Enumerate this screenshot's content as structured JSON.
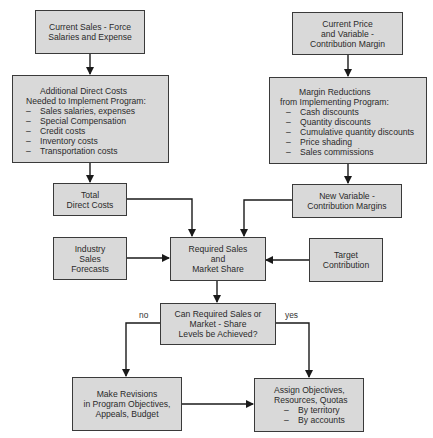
{
  "nodes": {
    "current_sales_force": {
      "lines": [
        "Current Sales - Force",
        "Salaries and Expense"
      ]
    },
    "additional_direct_costs": {
      "lines": [
        "Additional Direct Costs",
        "Needed to Implement Program:"
      ],
      "items": [
        "Sales salaries, expenses",
        "Special Compensation",
        "Credit costs",
        "Inventory costs",
        "Transportation costs"
      ]
    },
    "total_direct_costs": {
      "lines": [
        "Total",
        "Direct Costs"
      ]
    },
    "industry_sales_forecasts": {
      "lines": [
        "Industry",
        "Sales",
        "Forecasts"
      ]
    },
    "required_sales": {
      "lines": [
        "Required Sales",
        "and",
        "Market Share"
      ]
    },
    "current_price": {
      "lines": [
        "Current Price",
        "and Variable -",
        "Contribution Margin"
      ]
    },
    "margin_reductions": {
      "lines": [
        "Margin Reductions",
        "from Implementing Program:"
      ],
      "items": [
        "Cash discounts",
        "Quantity discounts",
        "Cumulative quantity discounts",
        "Price shading",
        "Sales commissions"
      ]
    },
    "new_variable_margins": {
      "lines": [
        "New Variable -",
        "Contribution Margins"
      ]
    },
    "target_contribution": {
      "lines": [
        "Target",
        "Contribution"
      ]
    },
    "decision": {
      "lines": [
        "Can Required Sales or",
        "Market - Share",
        "Levels be Achieved?"
      ]
    },
    "make_revisions": {
      "lines": [
        "Make Revisions",
        "in Program Objectives,",
        "Appeals, Budget"
      ]
    },
    "assign_objectives": {
      "lines": [
        "Assign Objectives,",
        "Resources, Quotas"
      ],
      "items": [
        "By territory",
        "By accounts"
      ]
    }
  },
  "edge_labels": {
    "no": "no",
    "yes": "yes"
  },
  "list_marker": "–",
  "colors": {
    "box_fill": "#d9d9d9",
    "border": "#3a3a3a",
    "line": "#1a1a1a"
  }
}
